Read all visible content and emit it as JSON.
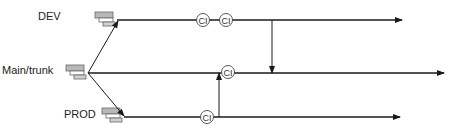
{
  "diagram": {
    "type": "branching-workflow",
    "branches": [
      {
        "id": "dev",
        "label": "DEV"
      },
      {
        "id": "main",
        "label": "Main/trunk"
      },
      {
        "id": "prod",
        "label": "PROD"
      }
    ],
    "ci_nodes": [
      {
        "branch": "dev",
        "label": "CI"
      },
      {
        "branch": "dev",
        "label": "CI"
      },
      {
        "branch": "main",
        "label": "CI"
      },
      {
        "branch": "prod",
        "label": "CI"
      }
    ],
    "merges": [
      {
        "from": "dev",
        "to": "main"
      },
      {
        "from": "prod",
        "to": "main"
      }
    ],
    "colors": {
      "line": "#1a1a1a",
      "server_fill": "#b0b0b0",
      "server_stroke": "#555555"
    }
  }
}
